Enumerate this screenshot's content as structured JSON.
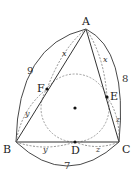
{
  "diagram": {
    "type": "geometry-incircle-tangent-lengths",
    "vertices": {
      "A": "A",
      "B": "B",
      "C": "C"
    },
    "tangent_points": {
      "D": "D",
      "E": "E",
      "F": "F"
    },
    "side_lengths": {
      "AB": "9",
      "AC": "8",
      "BC": "7"
    },
    "tangent_segments": {
      "AF": "x",
      "AE": "x",
      "BF": "y",
      "BD": "y",
      "CD": "z",
      "CE": "z"
    },
    "colors": {
      "stroke": "#333333",
      "dashed": "#777777",
      "circle": "#888888"
    }
  }
}
